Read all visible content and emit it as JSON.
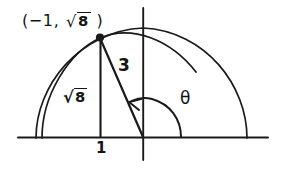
{
  "diagram": {
    "type": "unit-circle-trig-triangle",
    "labels": {
      "coordinate_open_paren": "(",
      "coordinate_x": "−1",
      "coordinate_comma": ",",
      "coordinate_y_radical_sign": "√",
      "coordinate_y_radicand": "8",
      "coordinate_close_paren": ")",
      "coordinate_full": "(−1, √8 )",
      "hypotenuse": "3",
      "opposite_radical_sign": "√",
      "opposite_radicand": "8",
      "opposite_full": "√8",
      "adjacent": "1",
      "angle": "θ"
    },
    "geometry": {
      "origin": {
        "x": 143,
        "y": 137
      },
      "point": {
        "x": 100,
        "y": 38
      },
      "x_axis": {
        "from_x": 18,
        "to_x": 268,
        "y": 137
      },
      "y_axis": {
        "x": 143,
        "from_y": 8,
        "to_y": 160
      },
      "outer_arc_radius": 109,
      "inner_arc_radius": 101,
      "angle_arc_radius": 38,
      "angle_degrees": 113
    },
    "colors": {
      "ink": "#1a1a1a",
      "background": "#ffffff",
      "text": "#141414"
    }
  }
}
